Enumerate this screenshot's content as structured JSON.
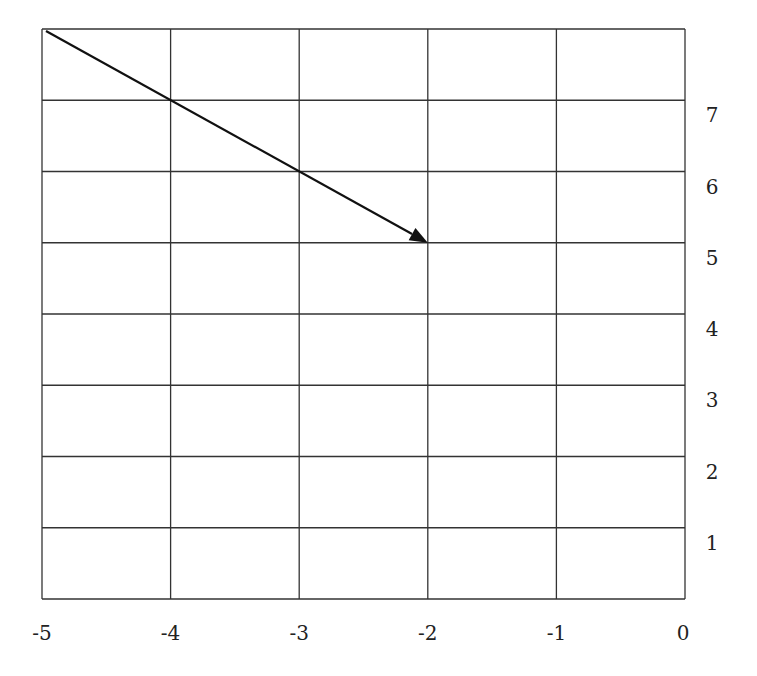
{
  "chart_data": {
    "type": "line",
    "title": "",
    "xlabel": "",
    "ylabel": "",
    "xlim": [
      -5,
      0
    ],
    "ylim": [
      0,
      8
    ],
    "grid": true,
    "x_ticks": [
      "-5",
      "-4",
      "-3",
      "-2",
      "-1",
      "0"
    ],
    "y_ticks": [
      "1",
      "2",
      "3",
      "4",
      "5",
      "6",
      "7"
    ],
    "y_tick_position": "right",
    "series": [
      {
        "name": "vector",
        "style": "arrow",
        "points": [
          [
            -5,
            8
          ],
          [
            -2,
            5
          ]
        ],
        "color": "#111111"
      }
    ]
  },
  "colors": {
    "grid": "#333333",
    "arrow": "#111111",
    "background": "#ffffff"
  }
}
